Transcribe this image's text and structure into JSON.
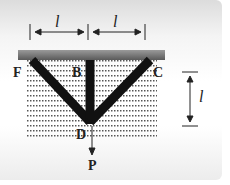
{
  "diagram": {
    "labels": {
      "F": "F",
      "B": "B",
      "C": "C",
      "D": "D",
      "P": "P"
    },
    "dimensions": {
      "left_span": "l",
      "right_span": "l",
      "height": "l"
    },
    "colors": {
      "bar": "#111111",
      "ceiling": "#777777",
      "dots": "#555555"
    }
  }
}
